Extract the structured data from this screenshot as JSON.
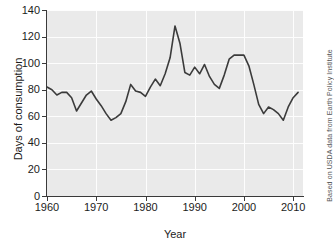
{
  "chart_data": {
    "type": "line",
    "title": "",
    "subtitle": "",
    "xlabel": "Year",
    "ylabel": "Days of consumption",
    "xlim": [
      1960,
      2012
    ],
    "ylim": [
      0,
      140
    ],
    "grid": true,
    "legend": null,
    "legend_position": "none",
    "line_color": "#3b3b3b",
    "plot_background": "#eaeaea",
    "gridline_color": "#fdfdfd",
    "xticks": [
      1960,
      1970,
      1980,
      1990,
      2000,
      2010
    ],
    "xtick_labels": [
      "1960",
      "1970",
      "1980",
      "1990",
      "2000",
      "2010"
    ],
    "yticks": [
      0,
      20,
      40,
      60,
      80,
      100,
      120,
      140
    ],
    "ytick_labels": [
      "0",
      "20",
      "40",
      "60",
      "80",
      "100",
      "120",
      "140"
    ],
    "x": [
      1960,
      1961,
      1962,
      1963,
      1964,
      1965,
      1966,
      1967,
      1968,
      1969,
      1970,
      1971,
      1972,
      1973,
      1974,
      1975,
      1976,
      1977,
      1978,
      1979,
      1980,
      1981,
      1982,
      1983,
      1984,
      1985,
      1986,
      1987,
      1988,
      1989,
      1990,
      1991,
      1992,
      1993,
      1994,
      1995,
      1996,
      1997,
      1998,
      1999,
      2000,
      2001,
      2002,
      2003,
      2004,
      2005,
      2006,
      2007,
      2008,
      2009,
      2010,
      2011
    ],
    "values": [
      82,
      80,
      76,
      78,
      78,
      74,
      64,
      70,
      76,
      79,
      73,
      68,
      62,
      57,
      59,
      62,
      71,
      84,
      79,
      78,
      75,
      82,
      88,
      83,
      92,
      104,
      128,
      115,
      93,
      91,
      97,
      92,
      99,
      90,
      84,
      81,
      91,
      103,
      106,
      106,
      106,
      98,
      84,
      69,
      62,
      67,
      65,
      62,
      57,
      67,
      74,
      78
    ],
    "series": [
      {
        "name": "Days of consumption",
        "values": [
          82,
          80,
          76,
          78,
          78,
          74,
          64,
          70,
          76,
          79,
          73,
          68,
          62,
          57,
          59,
          62,
          71,
          84,
          79,
          78,
          75,
          82,
          88,
          83,
          92,
          104,
          128,
          115,
          93,
          91,
          97,
          92,
          99,
          90,
          84,
          81,
          91,
          103,
          106,
          106,
          106,
          98,
          84,
          69,
          62,
          67,
          65,
          62,
          57,
          67,
          74,
          78
        ]
      }
    ],
    "annotations": [
      {
        "name": "source-attribution",
        "text": "Based on USDA data from Earth Policy Institute",
        "position": "right-edge-vertical",
        "rotation": -90
      }
    ]
  },
  "attribution": {
    "text": "Based on USDA data from Earth Policy Institute"
  }
}
